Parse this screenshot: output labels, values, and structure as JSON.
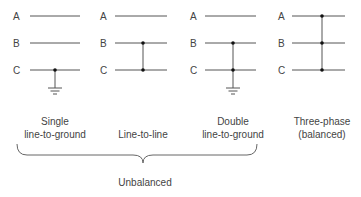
{
  "phase_labels": [
    "A",
    "B",
    "C"
  ],
  "colors": {
    "line": "#555555",
    "dot": "#111111",
    "text": "#444444"
  },
  "faults": [
    {
      "id": "single-line-to-ground",
      "caption_line1": "Single",
      "caption_line2": "line-to-ground",
      "label_x": 17,
      "line_x1": 30,
      "line_x2": 80,
      "junction_x": 55,
      "connected": [
        "C"
      ],
      "grounded": true
    },
    {
      "id": "line-to-line",
      "caption_line1": "Line-to-line",
      "caption_line2": "",
      "label_x": 102,
      "line_x1": 115,
      "line_x2": 167,
      "junction_x": 143,
      "connected": [
        "B",
        "C"
      ],
      "grounded": false
    },
    {
      "id": "double-line-to-ground",
      "caption_line1": "Double",
      "caption_line2": "line-to-ground",
      "label_x": 192,
      "line_x1": 205,
      "line_x2": 256,
      "junction_x": 233,
      "connected": [
        "B",
        "C"
      ],
      "grounded": true
    },
    {
      "id": "three-phase",
      "caption_line1": "Three-phase",
      "caption_line2": "(balanced)",
      "label_x": 280,
      "line_x1": 292,
      "line_x2": 345,
      "junction_x": 322,
      "connected": [
        "A",
        "B",
        "C"
      ],
      "grounded": false
    }
  ],
  "group": {
    "label": "Unbalanced",
    "brace_x1": 17,
    "brace_x2": 257,
    "brace_mid": 143
  }
}
